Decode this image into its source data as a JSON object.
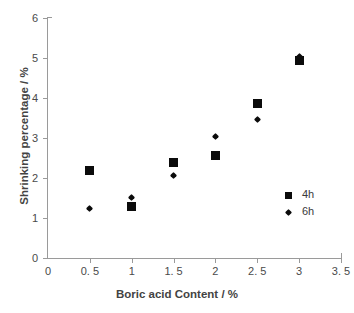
{
  "chart_data": {
    "type": "scatter",
    "title": "",
    "xlabel": "Boric acid Content / %",
    "ylabel": "Shrinking percentage / %",
    "xlim": [
      0,
      3.5
    ],
    "ylim": [
      0,
      6
    ],
    "xticks": [
      "0",
      "0. 5",
      "1",
      "1. 5",
      "2",
      "2. 5",
      "3",
      "3. 5"
    ],
    "xtick_values": [
      0,
      0.5,
      1,
      1.5,
      2,
      2.5,
      3,
      3.5
    ],
    "yticks": [
      "0",
      "1",
      "2",
      "3",
      "4",
      "5",
      "6"
    ],
    "ytick_values": [
      0,
      1,
      2,
      3,
      4,
      5,
      6
    ],
    "grid": false,
    "legend_position": "inside-right",
    "x": [
      0.5,
      1,
      1.5,
      2,
      2.5,
      3
    ],
    "series": [
      {
        "name": "4h",
        "marker": "square",
        "color": "#0b0b0b",
        "values": [
          2.18,
          1.3,
          2.4,
          2.56,
          3.87,
          4.95
        ]
      },
      {
        "name": "6h",
        "marker": "diamond",
        "color": "#0b0b0b",
        "values": [
          1.25,
          1.52,
          2.07,
          3.04,
          3.47,
          5.05
        ]
      }
    ]
  },
  "legend": {
    "items": [
      {
        "label": "4h",
        "marker": "square"
      },
      {
        "label": "6h",
        "marker": "diamond"
      }
    ]
  }
}
